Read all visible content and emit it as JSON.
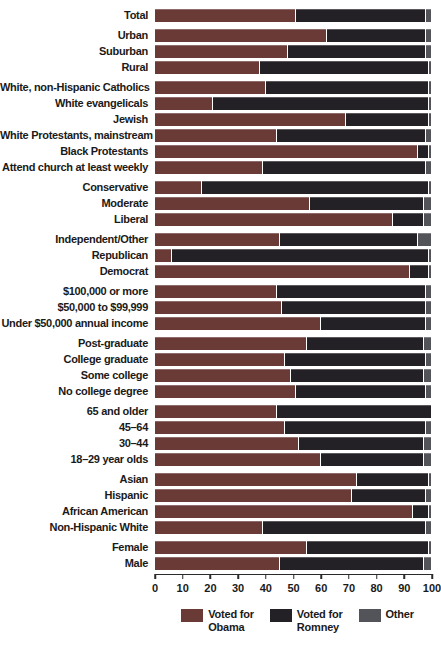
{
  "chart_data": {
    "type": "bar",
    "orientation": "horizontal",
    "stacked": true,
    "title": "",
    "xlabel": "",
    "ylabel": "",
    "xlim": [
      0,
      100
    ],
    "x_ticks": [
      0,
      10,
      20,
      30,
      40,
      50,
      60,
      70,
      80,
      90,
      100
    ],
    "grid": false,
    "legend_position": "bottom",
    "series_names": [
      "Voted for Obama",
      "Voted for Romney",
      "Other"
    ],
    "colors": {
      "obama": "#693a36",
      "romney": "#232126",
      "other": "#53535a"
    },
    "legend": [
      {
        "key": "obama",
        "label_lines": [
          "Voted for",
          "Obama"
        ]
      },
      {
        "key": "romney",
        "label_lines": [
          "Voted for",
          "Romney"
        ]
      },
      {
        "key": "other",
        "label_lines": [
          "Other"
        ]
      }
    ],
    "groups": [
      {
        "name": "total",
        "rows": [
          {
            "label": "Total",
            "obama": 51,
            "romney": 47,
            "other": 2
          }
        ]
      },
      {
        "name": "community-type",
        "rows": [
          {
            "label": "Urban",
            "obama": 62,
            "romney": 36,
            "other": 2
          },
          {
            "label": "Suburban",
            "obama": 48,
            "romney": 50,
            "other": 2
          },
          {
            "label": "Rural",
            "obama": 38,
            "romney": 61,
            "other": 1
          }
        ]
      },
      {
        "name": "religion",
        "rows": [
          {
            "label": "White, non-Hispanic Catholics",
            "obama": 40,
            "romney": 59,
            "other": 1
          },
          {
            "label": "White evangelicals",
            "obama": 21,
            "romney": 78,
            "other": 1
          },
          {
            "label": "Jewish",
            "obama": 69,
            "romney": 30,
            "other": 1
          },
          {
            "label": "White Protestants, mainstream",
            "obama": 44,
            "romney": 54,
            "other": 2
          },
          {
            "label": "Black Protestants",
            "obama": 95,
            "romney": 4,
            "other": 1
          },
          {
            "label": "Attend church at least weekly",
            "obama": 39,
            "romney": 59,
            "other": 2
          }
        ]
      },
      {
        "name": "ideology",
        "rows": [
          {
            "label": "Conservative",
            "obama": 17,
            "romney": 82,
            "other": 1
          },
          {
            "label": "Moderate",
            "obama": 56,
            "romney": 41,
            "other": 3
          },
          {
            "label": "Liberal",
            "obama": 86,
            "romney": 11,
            "other": 3
          }
        ]
      },
      {
        "name": "party",
        "rows": [
          {
            "label": "Independent/Other",
            "obama": 45,
            "romney": 50,
            "other": 5
          },
          {
            "label": "Republican",
            "obama": 6,
            "romney": 93,
            "other": 1
          },
          {
            "label": "Democrat",
            "obama": 92,
            "romney": 7,
            "other": 1
          }
        ]
      },
      {
        "name": "income",
        "rows": [
          {
            "label": "$100,000 or more",
            "obama": 44,
            "romney": 54,
            "other": 2
          },
          {
            "label": "$50,000 to $99,999",
            "obama": 46,
            "romney": 52,
            "other": 2
          },
          {
            "label": "Under $50,000 annual income",
            "obama": 60,
            "romney": 38,
            "other": 2
          }
        ]
      },
      {
        "name": "education",
        "rows": [
          {
            "label": "Post-graduate",
            "obama": 55,
            "romney": 42,
            "other": 3
          },
          {
            "label": "College graduate",
            "obama": 47,
            "romney": 51,
            "other": 2
          },
          {
            "label": "Some college",
            "obama": 49,
            "romney": 48,
            "other": 3
          },
          {
            "label": "No college degree",
            "obama": 51,
            "romney": 47,
            "other": 2
          }
        ]
      },
      {
        "name": "age",
        "rows": [
          {
            "label": "65 and older",
            "obama": 44,
            "romney": 56,
            "other": 0
          },
          {
            "label": "45–64",
            "obama": 47,
            "romney": 51,
            "other": 2
          },
          {
            "label": "30–44",
            "obama": 52,
            "romney": 45,
            "other": 3
          },
          {
            "label": "18–29 year olds",
            "obama": 60,
            "romney": 37,
            "other": 3
          }
        ]
      },
      {
        "name": "race-ethnicity",
        "rows": [
          {
            "label": "Asian",
            "obama": 73,
            "romney": 26,
            "other": 1
          },
          {
            "label": "Hispanic",
            "obama": 71,
            "romney": 27,
            "other": 2
          },
          {
            "label": "African American",
            "obama": 93,
            "romney": 6,
            "other": 1
          },
          {
            "label": "Non-Hispanic White",
            "obama": 39,
            "romney": 59,
            "other": 2
          }
        ]
      },
      {
        "name": "gender",
        "rows": [
          {
            "label": "Female",
            "obama": 55,
            "romney": 44,
            "other": 1
          },
          {
            "label": "Male",
            "obama": 45,
            "romney": 52,
            "other": 3
          }
        ]
      }
    ]
  }
}
